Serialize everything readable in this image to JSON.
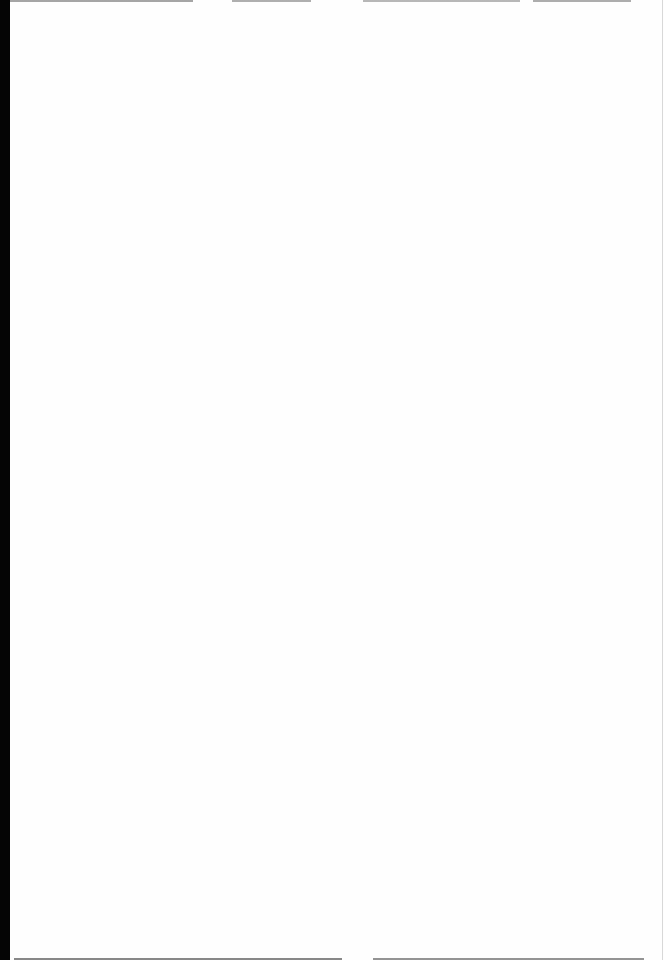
{
  "document": {
    "type": "scanned-page",
    "content": "",
    "background_color": "#fefefe",
    "edge_color": "#050505"
  }
}
